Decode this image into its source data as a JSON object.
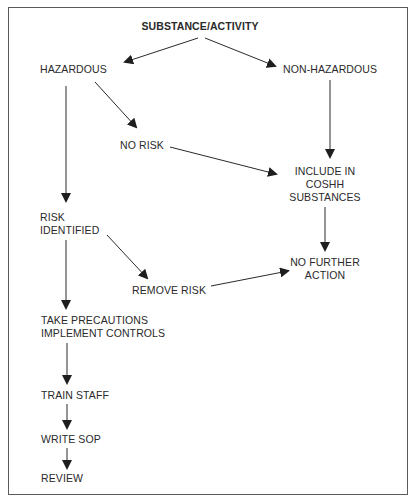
{
  "diagram": {
    "type": "flowchart",
    "nodes": {
      "root": {
        "label": "SUBSTANCE/ACTIVITY"
      },
      "hazardous": {
        "label": "HAZARDOUS"
      },
      "non_hazardous": {
        "label": "NON-HAZARDOUS"
      },
      "no_risk": {
        "label": "NO RISK"
      },
      "include": {
        "lines": [
          "INCLUDE IN",
          "COSHH",
          "SUBSTANCES"
        ]
      },
      "risk_identified": {
        "lines": [
          "RISK",
          "IDENTIFIED"
        ]
      },
      "no_further_action": {
        "lines": [
          "NO FURTHER",
          "ACTION"
        ]
      },
      "remove_risk": {
        "label": "REMOVE RISK"
      },
      "take_precautions": {
        "lines": [
          "TAKE PRECAUTIONS",
          "IMPLEMENT CONTROLS"
        ]
      },
      "train_staff": {
        "label": "TRAIN STAFF"
      },
      "write_sop": {
        "label": "WRITE SOP"
      },
      "review": {
        "label": "REVIEW"
      }
    },
    "edges": [
      {
        "from": "SUBSTANCE/ACTIVITY",
        "to": "HAZARDOUS"
      },
      {
        "from": "SUBSTANCE/ACTIVITY",
        "to": "NON-HAZARDOUS"
      },
      {
        "from": "HAZARDOUS",
        "to": "NO RISK"
      },
      {
        "from": "HAZARDOUS",
        "to": "RISK IDENTIFIED"
      },
      {
        "from": "NON-HAZARDOUS",
        "to": "INCLUDE IN COSHH SUBSTANCES"
      },
      {
        "from": "NO RISK",
        "to": "INCLUDE IN COSHH SUBSTANCES"
      },
      {
        "from": "INCLUDE IN COSHH SUBSTANCES",
        "to": "NO FURTHER ACTION"
      },
      {
        "from": "RISK IDENTIFIED",
        "to": "REMOVE RISK"
      },
      {
        "from": "REMOVE RISK",
        "to": "NO FURTHER ACTION"
      },
      {
        "from": "RISK IDENTIFIED",
        "to": "TAKE PRECAUTIONS IMPLEMENT CONTROLS"
      },
      {
        "from": "TAKE PRECAUTIONS IMPLEMENT CONTROLS",
        "to": "TRAIN STAFF"
      },
      {
        "from": "TRAIN STAFF",
        "to": "WRITE SOP"
      },
      {
        "from": "WRITE SOP",
        "to": "REVIEW"
      }
    ],
    "colors": {
      "line": "#2a2a2a",
      "border": "#5a5a5a",
      "background": "#ffffff"
    }
  }
}
